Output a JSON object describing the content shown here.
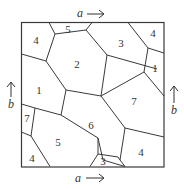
{
  "diagram": {
    "type": "square-surface-polygon-map",
    "edge_labels": {
      "top": "a",
      "bottom": "a",
      "left": "b",
      "right": "b"
    },
    "regions": [
      {
        "id": "r1",
        "label": "4",
        "position": "top-left corner"
      },
      {
        "id": "r2",
        "label": "5",
        "position": "top edge, left"
      },
      {
        "id": "r3",
        "label": "3",
        "position": "top edge, right"
      },
      {
        "id": "r4",
        "label": "4",
        "position": "top-right corner"
      },
      {
        "id": "r5",
        "label": "2",
        "position": "upper center"
      },
      {
        "id": "r6",
        "label": "1",
        "position": "right edge"
      },
      {
        "id": "r7",
        "label": "1",
        "position": "left edge"
      },
      {
        "id": "r8",
        "label": "7",
        "position": "right center"
      },
      {
        "id": "r9",
        "label": "6",
        "position": "center"
      },
      {
        "id": "r10",
        "label": "7",
        "position": "left edge, lower"
      },
      {
        "id": "r11",
        "label": "5",
        "position": "lower left"
      },
      {
        "id": "r12",
        "label": "4",
        "position": "bottom-left corner"
      },
      {
        "id": "r13",
        "label": "3",
        "position": "bottom edge, center"
      },
      {
        "id": "r14",
        "label": "4",
        "position": "bottom-right corner"
      }
    ]
  }
}
